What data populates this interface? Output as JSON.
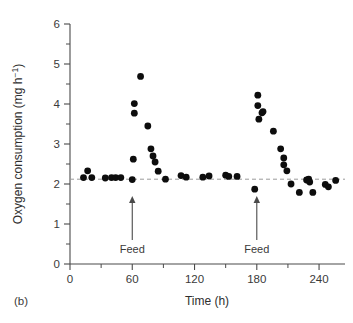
{
  "panel": {
    "label": "(b)"
  },
  "chart_data": {
    "type": "scatter",
    "title": "",
    "xlabel": "Time (h)",
    "ylabel_text": "Oxygen consumption (mg h",
    "ylabel_sup": "−1",
    "ylabel_tail": ")",
    "ylabel_full": "Oxygen consumption (mg h⁻¹)",
    "xlim": [
      0,
      265
    ],
    "ylim": [
      0,
      6
    ],
    "xticks": [
      0,
      60,
      120,
      180,
      240
    ],
    "xtick_labels": [
      "0",
      "60",
      "120",
      "180",
      "240"
    ],
    "xticks_minor": [
      30,
      90,
      150,
      210
    ],
    "yticks": [
      0,
      1,
      2,
      3,
      4,
      5,
      6
    ],
    "ytick_labels": [
      "0",
      "1",
      "2",
      "3",
      "4",
      "5",
      "6"
    ],
    "yticks_minor": [
      0.5,
      1.5,
      2.5,
      3.5,
      4.5,
      5.5
    ],
    "grid": false,
    "legend": "none",
    "marker_color": "#0d0d0d",
    "marker_shape": "filled-circle",
    "baseline": {
      "value": 2.12,
      "style": "dashed",
      "color": "#9a9a9a"
    },
    "annotations": [
      {
        "label": "Feed",
        "x": 60,
        "type": "up-arrow"
      },
      {
        "label": "Feed",
        "x": 180,
        "type": "up-arrow"
      }
    ],
    "points": [
      {
        "x": 13,
        "y": 2.16
      },
      {
        "x": 17,
        "y": 2.33
      },
      {
        "x": 21,
        "y": 2.16
      },
      {
        "x": 34,
        "y": 2.15
      },
      {
        "x": 40,
        "y": 2.16
      },
      {
        "x": 44,
        "y": 2.16
      },
      {
        "x": 49,
        "y": 2.16
      },
      {
        "x": 60,
        "y": 2.11
      },
      {
        "x": 61,
        "y": 2.62
      },
      {
        "x": 62,
        "y": 4.01
      },
      {
        "x": 62,
        "y": 3.77
      },
      {
        "x": 68,
        "y": 4.69
      },
      {
        "x": 75,
        "y": 3.45
      },
      {
        "x": 78,
        "y": 2.88
      },
      {
        "x": 80,
        "y": 2.7
      },
      {
        "x": 82,
        "y": 2.55
      },
      {
        "x": 85,
        "y": 2.32
      },
      {
        "x": 92,
        "y": 2.12
      },
      {
        "x": 107,
        "y": 2.21
      },
      {
        "x": 112,
        "y": 2.17
      },
      {
        "x": 128,
        "y": 2.17
      },
      {
        "x": 134,
        "y": 2.2
      },
      {
        "x": 150,
        "y": 2.22
      },
      {
        "x": 153,
        "y": 2.19
      },
      {
        "x": 161,
        "y": 2.19
      },
      {
        "x": 178,
        "y": 1.87
      },
      {
        "x": 181,
        "y": 4.22
      },
      {
        "x": 181,
        "y": 3.96
      },
      {
        "x": 182,
        "y": 3.62
      },
      {
        "x": 185,
        "y": 3.78
      },
      {
        "x": 186,
        "y": 3.81
      },
      {
        "x": 196,
        "y": 3.32
      },
      {
        "x": 203,
        "y": 2.88
      },
      {
        "x": 206,
        "y": 2.65
      },
      {
        "x": 206,
        "y": 2.48
      },
      {
        "x": 209,
        "y": 2.33
      },
      {
        "x": 213,
        "y": 2.0
      },
      {
        "x": 221,
        "y": 1.79
      },
      {
        "x": 228,
        "y": 2.1
      },
      {
        "x": 230,
        "y": 2.12
      },
      {
        "x": 231,
        "y": 2.05
      },
      {
        "x": 234,
        "y": 1.79
      },
      {
        "x": 246,
        "y": 1.99
      },
      {
        "x": 249,
        "y": 1.93
      },
      {
        "x": 256,
        "y": 2.09
      }
    ]
  }
}
